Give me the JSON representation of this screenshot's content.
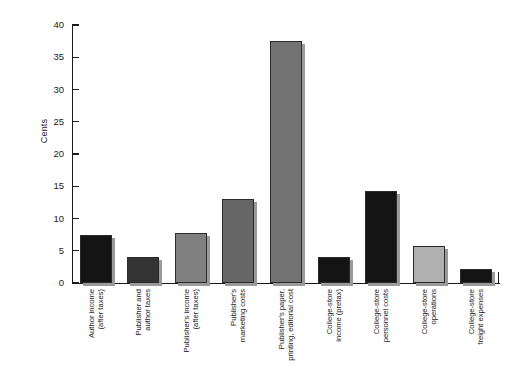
{
  "chart_data": {
    "type": "bar",
    "title": "",
    "subtitle": "",
    "xlabel": "",
    "ylabel": "Cents",
    "ylim": [
      0,
      40
    ],
    "yticks": [
      0,
      5,
      10,
      15,
      20,
      25,
      30,
      35,
      40
    ],
    "ytick_labels": [
      "0",
      "5",
      "10",
      "15",
      "20",
      "25",
      "30",
      "35",
      "40"
    ],
    "grid": false,
    "legend": "none",
    "categories": [
      "Author income (after taxes)",
      "Publisher and author taxes",
      "Publisher's income (after taxes)",
      "Publisher's marketing costs",
      "Publisher's paper, printing, editorial cost",
      "College-store income (pretax)",
      "College-store personnel costs",
      "College-store operations",
      "College-store freight expenses"
    ],
    "category_lines": [
      [
        "Author income",
        "(after taxes)"
      ],
      [
        "Publisher and",
        "author taxes"
      ],
      [
        "Publisher's income",
        "(after taxes)"
      ],
      [
        "Publisher's",
        "marketing costs"
      ],
      [
        "Publisher's paper,",
        "printing, editorial cost"
      ],
      [
        "College-store",
        "income (pretax)"
      ],
      [
        "College-store",
        "personnel costs"
      ],
      [
        "College-store",
        "operations"
      ],
      [
        "College-store",
        "freight expenses"
      ]
    ],
    "values": [
      7.4,
      4.0,
      7.7,
      13.0,
      37.5,
      4.1,
      14.3,
      5.8,
      2.1
    ],
    "colors": [
      "#141414",
      "#333333",
      "#808080",
      "#666666",
      "#737373",
      "#141414",
      "#141414",
      "#b0b0b0",
      "#141414"
    ],
    "bar_edge_color": "#2b2b2b",
    "shadow_color": "#9a9a9a",
    "axis_color": "#1a1a1a",
    "background_color": "#ffffff"
  }
}
